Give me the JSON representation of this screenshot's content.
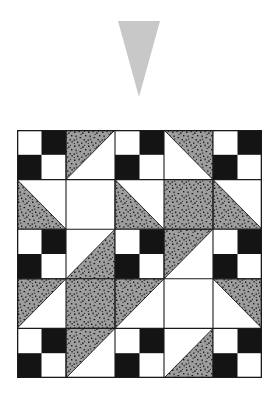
{
  "page": {
    "title": "Quilt Block Layout Diagram",
    "background_color": "#ffffff",
    "width": 277,
    "height": 413
  },
  "marker": {
    "name": "downward-pointing-triangle-marker",
    "shape": "triangle-down",
    "fill_color": "#c8c8c8",
    "x": 118,
    "y": 21,
    "width": 42,
    "height": 76
  },
  "quilt": {
    "caption": "",
    "x": 17,
    "y": 130,
    "width": 245,
    "height": 248,
    "rows": 5,
    "cols": 5,
    "cell_size": 49,
    "border_color": "#1a1a1a",
    "border_width": 1.2,
    "colors": {
      "black": "#141414",
      "white": "#ffffff",
      "gray_speckle_base": "#9e9e9e",
      "gray_speckle_dots": "#1e1e1e",
      "outline": "#1a1a1a"
    },
    "legend": [
      {
        "key": "checker",
        "label": "Four-patch checkerboard (white / black)"
      },
      {
        "key": "tri_ul",
        "label": "Half-square triangle, upper-left speckled gray"
      },
      {
        "key": "tri_ur",
        "label": "Half-square triangle, upper-right speckled gray"
      },
      {
        "key": "tri_ll",
        "label": "Half-square triangle, lower-left speckled gray"
      },
      {
        "key": "tri_lr",
        "label": "Half-square triangle, lower-right speckled gray"
      },
      {
        "key": "gray",
        "label": "Solid speckled gray square"
      },
      {
        "key": "white",
        "label": "Plain white square"
      }
    ],
    "grid": [
      [
        "checker",
        "tri_ul",
        "checker",
        "tri_ur",
        "checker"
      ],
      [
        "tri_ll",
        "white",
        "tri_ll",
        "gray",
        "tri_ll"
      ],
      [
        "checker",
        "tri_lr",
        "checker",
        "tri_ul",
        "checker"
      ],
      [
        "tri_ul",
        "gray",
        "tri_ul",
        "white",
        "tri_ur"
      ],
      [
        "checker",
        "tri_ul",
        "checker",
        "tri_lr",
        "checker"
      ]
    ]
  }
}
